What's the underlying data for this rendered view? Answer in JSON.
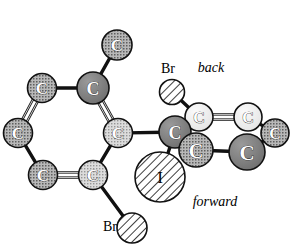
{
  "figure": {
    "title": "",
    "type": "molecular-structure-diagram",
    "background_color": "#ffffff",
    "bond_color": "#111111",
    "width": 301,
    "height": 247
  },
  "annotations": [
    {
      "id": "back-label",
      "text": "back",
      "x": 211,
      "y": 72,
      "style": "italic",
      "size": 14
    },
    {
      "id": "forward-label",
      "text": "forward",
      "x": 215,
      "y": 206,
      "style": "italic",
      "size": 14
    },
    {
      "id": "br-top-label",
      "text": "Br",
      "x": 168,
      "y": 73,
      "style": "plain",
      "size": 14
    },
    {
      "id": "br-bottom-label",
      "text": "Br",
      "x": 110,
      "y": 231,
      "style": "plain",
      "size": 14
    }
  ],
  "atoms": [
    {
      "id": "c-methyl-top",
      "label": "C",
      "x": 117,
      "y": 45,
      "r": 15,
      "fill": "stipple-mid",
      "name": "atom-carbon-methyl-top"
    },
    {
      "id": "c-ring1-a",
      "label": "C",
      "x": 42,
      "y": 88,
      "r": 14.5,
      "fill": "stipple-mid",
      "name": "atom-carbon-ring1-a"
    },
    {
      "id": "c-ring1-b",
      "label": "C",
      "x": 93,
      "y": 88,
      "r": 16,
      "fill": "solid-dark",
      "name": "atom-carbon-ring1-b"
    },
    {
      "id": "c-ring1-c",
      "label": "C",
      "x": 18,
      "y": 133,
      "r": 14.5,
      "fill": "stipple-mid",
      "name": "atom-carbon-ring1-c"
    },
    {
      "id": "c-ring1-d",
      "label": "C",
      "x": 118,
      "y": 133,
      "r": 14.5,
      "fill": "stipple-light",
      "name": "atom-carbon-ring1-d"
    },
    {
      "id": "c-ring1-e",
      "label": "C",
      "x": 43,
      "y": 175,
      "r": 14.5,
      "fill": "stipple-mid",
      "name": "atom-carbon-ring1-e"
    },
    {
      "id": "c-ring1-f",
      "label": "C",
      "x": 93,
      "y": 175,
      "r": 14.5,
      "fill": "stipple-light",
      "name": "atom-carbon-ring1-f"
    },
    {
      "id": "br-bottom",
      "label": "",
      "x": 132,
      "y": 228,
      "r": 15,
      "fill": "hatch",
      "name": "atom-bromine-bottom"
    },
    {
      "id": "br-top",
      "label": "",
      "x": 172,
      "y": 92,
      "r": 12.5,
      "fill": "hatch",
      "name": "atom-bromine-top"
    },
    {
      "id": "c-ring2-a",
      "label": "C",
      "x": 199,
      "y": 117,
      "r": 14,
      "fill": "light",
      "name": "atom-carbon-ring2-a"
    },
    {
      "id": "c-ring2-b",
      "label": "C",
      "x": 248,
      "y": 117,
      "r": 14,
      "fill": "light",
      "name": "atom-carbon-ring2-b"
    },
    {
      "id": "c-quaternary",
      "label": "C",
      "x": 175,
      "y": 132,
      "r": 16,
      "fill": "solid-dark",
      "name": "atom-carbon-quaternary"
    },
    {
      "id": "c-ring2-f",
      "label": "C",
      "x": 275,
      "y": 133,
      "r": 14,
      "fill": "stipple-mid",
      "name": "atom-carbon-ring2-f"
    },
    {
      "id": "c-ring2-d",
      "label": "C",
      "x": 196,
      "y": 150,
      "r": 17,
      "fill": "stipple-mid",
      "name": "atom-carbon-ring2-d"
    },
    {
      "id": "c-ring2-e",
      "label": "C",
      "x": 247,
      "y": 152,
      "r": 18,
      "fill": "solid-dark",
      "name": "atom-carbon-ring2-e"
    },
    {
      "id": "iodine",
      "label": "I",
      "x": 160,
      "y": 177,
      "r": 25,
      "fill": "hatch",
      "name": "atom-iodine"
    }
  ],
  "bonds": [
    {
      "from": "c-ring1-b",
      "to": "c-methyl-top",
      "order": 1,
      "name": "bond-ring1b-methyl"
    },
    {
      "from": "c-ring1-a",
      "to": "c-ring1-b",
      "order": 1,
      "name": "bond-ring1a-ring1b"
    },
    {
      "from": "c-ring1-a",
      "to": "c-ring1-c",
      "order": 2,
      "name": "bond-ring1a-ring1c"
    },
    {
      "from": "c-ring1-b",
      "to": "c-ring1-d",
      "order": 2,
      "name": "bond-ring1b-ring1d"
    },
    {
      "from": "c-ring1-c",
      "to": "c-ring1-e",
      "order": 1,
      "name": "bond-ring1c-ring1e"
    },
    {
      "from": "c-ring1-e",
      "to": "c-ring1-f",
      "order": 2,
      "name": "bond-ring1e-ring1f"
    },
    {
      "from": "c-ring1-d",
      "to": "c-ring1-f",
      "order": 1,
      "name": "bond-ring1d-ring1f"
    },
    {
      "from": "c-ring1-f",
      "to": "br-bottom",
      "order": 1,
      "name": "bond-ring1f-bromine"
    },
    {
      "from": "c-ring1-d",
      "to": "c-quaternary",
      "order": 1,
      "name": "bond-ring1d-quaternary"
    },
    {
      "from": "br-top",
      "to": "c-ring2-a",
      "order": 1,
      "name": "bond-bromine-ring2a"
    },
    {
      "from": "c-ring2-a",
      "to": "c-ring2-b",
      "order": 2,
      "name": "bond-ring2a-ring2b"
    },
    {
      "from": "c-quaternary",
      "to": "c-ring2-a",
      "order": 1,
      "name": "bond-quaternary-ring2a"
    },
    {
      "from": "c-quaternary",
      "to": "c-ring2-d",
      "order": 1,
      "name": "bond-quaternary-ring2d"
    },
    {
      "from": "c-ring2-b",
      "to": "c-ring2-f",
      "order": 1,
      "name": "bond-ring2b-ring2f"
    },
    {
      "from": "c-ring2-d",
      "to": "c-ring2-e",
      "order": 1,
      "name": "bond-ring2d-ring2e"
    },
    {
      "from": "c-ring2-e",
      "to": "c-ring2-f",
      "order": 1,
      "name": "bond-ring2e-ring2f"
    },
    {
      "from": "c-quaternary",
      "to": "iodine",
      "order": 1,
      "name": "bond-quaternary-iodine"
    }
  ],
  "palette": {
    "bond": "#111111",
    "outline": "#111111",
    "solid_dark": "#7d7d7d",
    "stipple_mid": "#9a9a9a",
    "stipple_light": "#c9c9c9",
    "light": "#ededed",
    "hatch": "#ffffff",
    "label_text": "#ffffff",
    "annotation_text": "#000000"
  }
}
